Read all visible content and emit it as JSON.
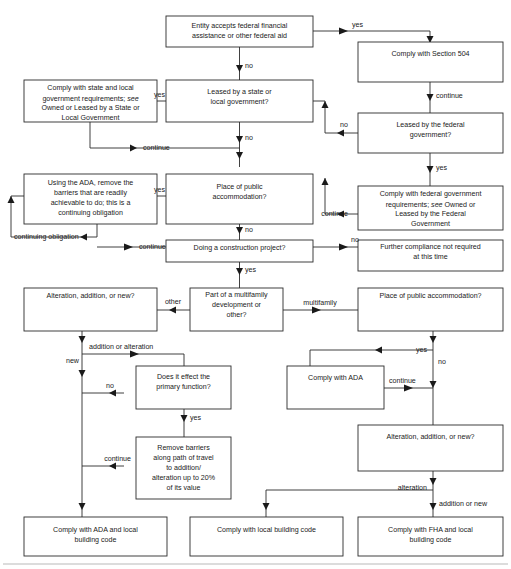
{
  "diagram": {
    "colors": {
      "background": "#ffffff",
      "box_fill": "#ffffff",
      "box_stroke": "#2b2b2b",
      "line": "#2b2b2b",
      "text": "#1a1a1a",
      "rule": "#b9b9b9"
    },
    "nodes": [
      {
        "id": "n01",
        "name": "entity-accepts-federal-aid",
        "lines": [
          "Entity accepts federal financial",
          "assistance or other federal aid"
        ]
      },
      {
        "id": "n02",
        "name": "comply-with-section-504",
        "lines": [
          "Comply with Section 504"
        ]
      },
      {
        "id": "n03",
        "name": "leased-by-federal-government",
        "lines": [
          "Leased by the federal",
          "government?"
        ]
      },
      {
        "id": "n04",
        "name": "comply-with-federal-government-requirements",
        "lines": [
          "Comply with federal government",
          "requirements; see Owned or",
          "Leased by the Federal",
          "Government"
        ],
        "italic_words": [
          "see"
        ]
      },
      {
        "id": "n05",
        "name": "leased-by-state-or-local-government",
        "lines": [
          "Leased by a state or",
          "local government?"
        ]
      },
      {
        "id": "n06",
        "name": "comply-with-state-and-local-requirements",
        "lines": [
          "Comply with state and local",
          "government requirements; see",
          "Owned or Leased by a State or",
          "Local Government"
        ],
        "italic_words": [
          "see"
        ]
      },
      {
        "id": "n07",
        "name": "place-of-public-accommodation-upper",
        "lines": [
          "Place of public",
          "accommodation?"
        ]
      },
      {
        "id": "n08",
        "name": "using-the-ada-remove-barriers",
        "lines": [
          "Using the ADA, remove the",
          "barriers that are readily",
          "achievable to do; this is a",
          "continuing obligation"
        ]
      },
      {
        "id": "n09",
        "name": "doing-a-construction-project",
        "lines": [
          "Doing a construction project?"
        ]
      },
      {
        "id": "n10",
        "name": "further-compliance-not-required",
        "lines": [
          "Further compliance not required",
          "at this time"
        ]
      },
      {
        "id": "n11",
        "name": "part-of-a-multifamily-development",
        "lines": [
          "Part of a multifamily",
          "development or",
          "other?"
        ]
      },
      {
        "id": "n12",
        "name": "alteration-addition-or-new-left",
        "lines": [
          "Alteration, addition, or new?"
        ]
      },
      {
        "id": "n13",
        "name": "place-of-public-accommodation-lower",
        "lines": [
          "Place of public accommodation?"
        ]
      },
      {
        "id": "n14",
        "name": "does-it-effect-the-primary-function",
        "lines": [
          "Does it effect the",
          "primary function?"
        ]
      },
      {
        "id": "n15",
        "name": "comply-with-ada",
        "lines": [
          "Comply with ADA"
        ]
      },
      {
        "id": "n16",
        "name": "remove-barriers-path-of-travel",
        "lines": [
          "Remove barriers",
          "along path of travel",
          "to addition/",
          "alteration up to 20%",
          "of its value"
        ]
      },
      {
        "id": "n17",
        "name": "alteration-addition-or-new-right",
        "lines": [
          "Alteration, addition, or new?"
        ]
      },
      {
        "id": "n18",
        "name": "comply-with-ada-and-local-building-code",
        "lines": [
          "Comply with ADA and local",
          "building code"
        ]
      },
      {
        "id": "n19",
        "name": "comply-with-local-building-code",
        "lines": [
          "Comply with local building code"
        ]
      },
      {
        "id": "n20",
        "name": "comply-with-fha-and-local-building-code",
        "lines": [
          "Comply with FHA and local",
          "building code"
        ]
      }
    ],
    "edge_labels": [
      {
        "id": "e01",
        "name": "edge-label-yes-to-504",
        "text": "yes"
      },
      {
        "id": "e02",
        "name": "edge-label-no-from-entity",
        "text": "no"
      },
      {
        "id": "e03",
        "name": "edge-label-continue-504-to-federal",
        "text": "continue"
      },
      {
        "id": "e04",
        "name": "edge-label-no-federal-lease",
        "text": "no"
      },
      {
        "id": "e05",
        "name": "edge-label-yes-federal-lease",
        "text": "yes"
      },
      {
        "id": "e06",
        "name": "edge-label-continue-federal-requirements",
        "text": "continue"
      },
      {
        "id": "e07",
        "name": "edge-label-yes-state-lease",
        "text": "yes"
      },
      {
        "id": "e08",
        "name": "edge-label-no-state-lease",
        "text": "no"
      },
      {
        "id": "e09",
        "name": "edge-label-continue-state-requirements",
        "text": "continue"
      },
      {
        "id": "e10",
        "name": "edge-label-yes-public-accommodation",
        "text": "yes"
      },
      {
        "id": "e11",
        "name": "edge-label-no-public-accommodation",
        "text": "no"
      },
      {
        "id": "e12",
        "name": "edge-label-continuing-obligation",
        "text": "continuing obligation"
      },
      {
        "id": "e13",
        "name": "edge-label-continue-ada-barriers",
        "text": "continue"
      },
      {
        "id": "e14",
        "name": "edge-label-no-construction",
        "text": "no"
      },
      {
        "id": "e15",
        "name": "edge-label-yes-construction",
        "text": "yes"
      },
      {
        "id": "e16",
        "name": "edge-label-other-multifamily",
        "text": "other"
      },
      {
        "id": "e17",
        "name": "edge-label-multifamily",
        "text": "multifamily"
      },
      {
        "id": "e18",
        "name": "edge-label-addition-or-alteration",
        "text": "addition or alteration"
      },
      {
        "id": "e19",
        "name": "edge-label-new",
        "text": "new"
      },
      {
        "id": "e20",
        "name": "edge-label-no-primary-function",
        "text": "no"
      },
      {
        "id": "e21",
        "name": "edge-label-yes-primary-function",
        "text": "yes"
      },
      {
        "id": "e22",
        "name": "edge-label-continue-remove-barriers",
        "text": "continue"
      },
      {
        "id": "e23",
        "name": "edge-label-yes-public-accommodation-lower",
        "text": "yes"
      },
      {
        "id": "e24",
        "name": "edge-label-no-public-accommodation-lower",
        "text": "no"
      },
      {
        "id": "e25",
        "name": "edge-label-continue-comply-ada",
        "text": "continue"
      },
      {
        "id": "e26",
        "name": "edge-label-alteration",
        "text": "alteration"
      },
      {
        "id": "e27",
        "name": "edge-label-addition-or-new",
        "text": "addition or new"
      }
    ]
  }
}
